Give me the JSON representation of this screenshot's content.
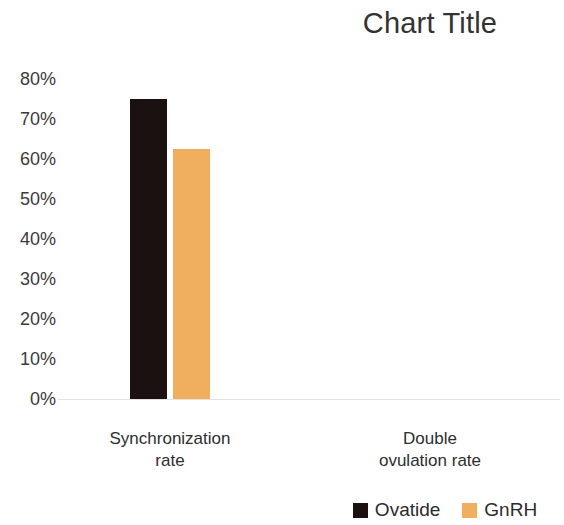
{
  "chart_data": {
    "type": "bar",
    "title": "Chart Title",
    "xlabel": "",
    "ylabel": "",
    "categories": [
      "Synchronization rate",
      "Double ovulation rate"
    ],
    "category_lines": [
      [
        "Synchronization",
        "rate"
      ],
      [
        "Double",
        "ovulation rate"
      ]
    ],
    "series": [
      {
        "name": "Ovatide",
        "color": "#1a1110",
        "values": [
          75,
          null
        ]
      },
      {
        "name": "GnRH",
        "color": "#f0af5f",
        "values": [
          62.5,
          null
        ]
      }
    ],
    "ylim": [
      0,
      80
    ],
    "ytick_values": [
      80,
      70,
      60,
      50,
      40,
      30,
      20,
      10,
      0
    ],
    "ytick_labels": [
      "80%",
      "70%",
      "60%",
      "50%",
      "40%",
      "30%",
      "20%",
      "10%",
      "0%"
    ],
    "grid": false,
    "legend_position": "bottom-right",
    "value_format": "percent"
  },
  "title": {
    "text": "Chart Title"
  },
  "axis": {
    "y_ticks": [
      {
        "label": "80%",
        "value": 80
      },
      {
        "label": "70%",
        "value": 70
      },
      {
        "label": "60%",
        "value": 60
      },
      {
        "label": "50%",
        "value": 50
      },
      {
        "label": "40%",
        "value": 40
      },
      {
        "label": "30%",
        "value": 30
      },
      {
        "label": "20%",
        "value": 20
      },
      {
        "label": "10%",
        "value": 10
      },
      {
        "label": "0%",
        "value": 0
      }
    ],
    "categories": [
      {
        "line1": "Synchronization",
        "line2": "rate"
      },
      {
        "line1": "Double",
        "line2": "ovulation rate"
      }
    ]
  },
  "legend": {
    "items": [
      {
        "label": "Ovatide",
        "color": "#1a1110"
      },
      {
        "label": "GnRH",
        "color": "#f0af5f"
      }
    ]
  },
  "colors": {
    "series_ovatide": "#1a1110",
    "series_gnrh": "#f0af5f",
    "axis_line": "#e3e3e3",
    "text": "#333333",
    "background": "#ffffff"
  }
}
